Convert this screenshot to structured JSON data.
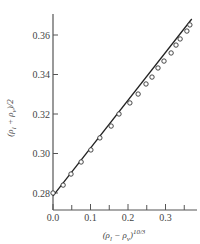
{
  "chart_data": {
    "type": "scatter",
    "title": "",
    "xlabel": "(ρl − ρv)^10/3",
    "ylabel": "(ρl + ρv)/2",
    "xlabel_parts": {
      "base": "(ρ",
      "sub1": "l",
      "mid": " − ρ",
      "sub2": "v",
      "close": ")",
      "sup": "10/3"
    },
    "ylabel_parts": {
      "base": "(ρ",
      "sub1": "l",
      "mid": " + ρ",
      "sub2": "v",
      "close": ")/2"
    },
    "xlim": [
      0.0,
      0.37
    ],
    "ylim": [
      0.275,
      0.37
    ],
    "x_ticks": [
      0.0,
      0.1,
      0.2,
      0.3
    ],
    "x_tick_labels": [
      "0.0",
      "0.1",
      "0.2",
      "0.3"
    ],
    "x_minor_ticks": [
      0.05,
      0.15,
      0.25,
      0.35
    ],
    "y_ticks": [
      0.28,
      0.3,
      0.32,
      0.34,
      0.36
    ],
    "y_tick_labels": [
      "0.28",
      "0.30",
      "0.32",
      "0.34",
      "0.36"
    ],
    "grid": false,
    "legend": null,
    "series": [
      {
        "name": "data",
        "marker": "open-circle",
        "x": [
          0.0,
          0.027,
          0.048,
          0.075,
          0.101,
          0.125,
          0.155,
          0.176,
          0.205,
          0.227,
          0.248,
          0.264,
          0.28,
          0.296,
          0.315,
          0.328,
          0.339,
          0.357,
          0.365
        ],
        "y": [
          0.28,
          0.284,
          0.2896,
          0.2957,
          0.3018,
          0.3079,
          0.3139,
          0.32,
          0.3256,
          0.3301,
          0.3352,
          0.3387,
          0.3433,
          0.3468,
          0.3509,
          0.3549,
          0.358,
          0.362,
          0.3651
        ]
      },
      {
        "name": "fit",
        "type": "line",
        "x": [
          0.0,
          0.37
        ],
        "y": [
          0.2785,
          0.3681
        ]
      }
    ]
  }
}
